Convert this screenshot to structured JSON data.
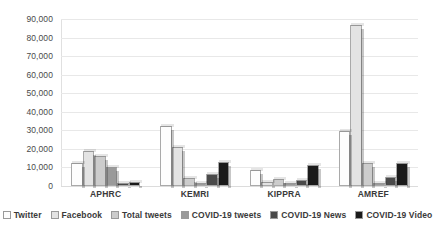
{
  "chart_data": {
    "type": "bar",
    "title": "",
    "subtitle": "",
    "xlabel": "",
    "ylabel": "",
    "categories": [
      "APHRC",
      "KEMRI",
      "KIPPRA",
      "AMREF"
    ],
    "series": [
      {
        "name": "Twitter",
        "color": "#fdfdfd",
        "values": [
          12500,
          32500,
          8500,
          29500
        ]
      },
      {
        "name": "Facebook",
        "color": "#e3e3e3",
        "values": [
          19000,
          21000,
          2000,
          87000
        ]
      },
      {
        "name": "Total tweets",
        "color": "#cccccc",
        "values": [
          16000,
          4500,
          4000,
          12500
        ]
      },
      {
        "name": "COVID-19 tweets",
        "color": "#9a9a9a",
        "values": [
          10500,
          1500,
          1500,
          1500
        ]
      },
      {
        "name": "COVID-19 News",
        "color": "#4a4a4a",
        "values": [
          1500,
          6500,
          3000,
          5000
        ]
      },
      {
        "name": "COVID-19 Video",
        "color": "#1a1a1a",
        "values": [
          2000,
          13000,
          11500,
          12500
        ]
      }
    ],
    "ylim": [
      0,
      90000
    ],
    "y_ticks": [
      0,
      10000,
      20000,
      30000,
      40000,
      50000,
      60000,
      70000,
      80000,
      90000
    ],
    "y_tick_labels": [
      "0",
      "10,000",
      "20,000",
      "30,000",
      "40,000",
      "50,000",
      "60,000",
      "70,000",
      "80,000",
      "90,000"
    ],
    "grid": true,
    "legend_position": "bottom",
    "background": "#ffffff",
    "gridline_color": "#e8e8e8"
  }
}
